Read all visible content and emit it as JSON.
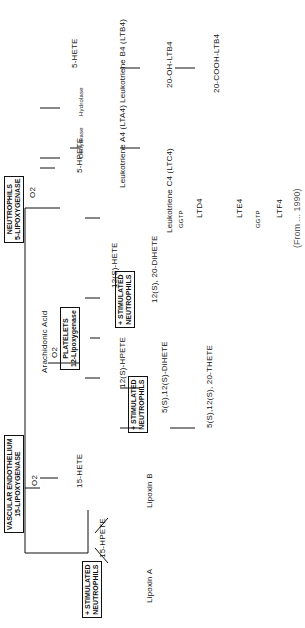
{
  "diagram": {
    "start": "Arachidonic Acid",
    "cells": {
      "vascular": {
        "line1": "VASCULAR ENDOTHELIUM",
        "line2": "15-LIPOXYGENASE"
      },
      "platelets": {
        "line1": "PLATELETS",
        "line2": "12-Lipoxygenase"
      },
      "neutrophils": {
        "line1": "NEUTROPHILS",
        "line2": "5-LIPOXYGENASE"
      },
      "stim1": {
        "line1": "+ STIMULATED",
        "line2": "NEUTROPHILS"
      },
      "stim2": {
        "line1": "+ STIMULATED",
        "line2": "NEUTROPHILS"
      },
      "stim3": {
        "line1": "+ STIMULATED",
        "line2": "NEUTROPHILS"
      }
    },
    "o2": "O2",
    "enzymes": {
      "dehydrase": "Dehydrase",
      "hydrolase": "Hydrolase",
      "ggtp1": "GGTP",
      "ggtp2": "GGTP"
    },
    "compounds": {
      "hete15": "15-HETE",
      "hpete15": "15-HPETE",
      "lipoxinA": "Lipoxin A",
      "lipoxinB": "Lipoxin B",
      "hpete12": "12(S)-HPETE",
      "hete12": "12(S)-HETE",
      "dihete1220": "12(S), 20-DiHETE",
      "dihete512": "5(S),12(S)-DiHETE",
      "trihete": "5(S),12(S), 20-THETE",
      "hpete5": "5-HPETE",
      "hete5": "5-HETE",
      "lta4": "Leukotriene A4 (LTA4)",
      "ltb4": "Leukotriene B4 (LTB4)",
      "oh_ltb4": "20-OH-LTB4",
      "cooh_ltb4": "20-COOH-LTB4",
      "ltc4": "Leukotriene C4 (LTC4)",
      "ltd4": "LTD4",
      "lte4": "LTE4",
      "ltf4": "LTF4"
    },
    "caption": "(From ... 1990)"
  }
}
